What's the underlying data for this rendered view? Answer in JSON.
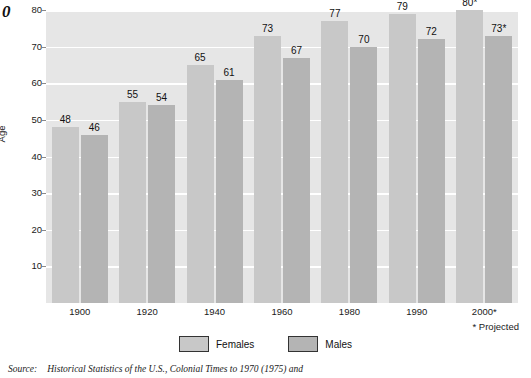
{
  "page": {
    "page_number_fragment": "0"
  },
  "chart_data": {
    "type": "bar",
    "title": "",
    "xlabel": "",
    "ylabel": "Age",
    "ylim": [
      0,
      80
    ],
    "yticks": [
      10,
      20,
      30,
      40,
      50,
      60,
      70,
      80
    ],
    "grid": true,
    "legend_position": "bottom",
    "categories": [
      "1900",
      "1920",
      "1940",
      "1960",
      "1980",
      "1990",
      "2000*"
    ],
    "series": [
      {
        "name": "Females",
        "color": "#c8c8c8",
        "values": [
          48,
          55,
          65,
          73,
          77,
          79,
          80
        ],
        "labels": [
          "48",
          "55",
          "65",
          "73",
          "77",
          "79",
          "80*"
        ]
      },
      {
        "name": "Males",
        "color": "#b4b4b4",
        "values": [
          46,
          54,
          61,
          67,
          70,
          72,
          73
        ],
        "labels": [
          "46",
          "54",
          "61",
          "67",
          "70",
          "72",
          "73*"
        ]
      }
    ],
    "annotations": [
      "* Projected"
    ]
  },
  "footnote": {
    "projected_note": "* Projected"
  },
  "source": {
    "label": "Source:",
    "text": "Historical Statistics of the U.S., Colonial Times to 1970 (1975) and"
  },
  "colors": {
    "plot_background": "#e6e6e6",
    "gridline": "#ffffff",
    "females_bar": "#c8c8c8",
    "males_bar": "#b4b4b4",
    "text": "#1a1a1a"
  }
}
